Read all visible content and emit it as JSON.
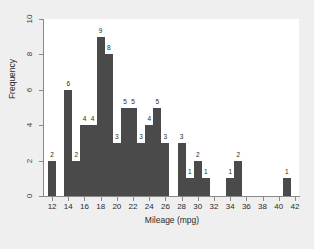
{
  "chart_data": {
    "type": "bar",
    "title": "",
    "subtitle": "",
    "xlabel": "Mileage (mpg)",
    "ylabel": "Frequency",
    "xlim": [
      11.0,
      42.5
    ],
    "ylim": [
      0,
      10
    ],
    "grid": false,
    "legend": null,
    "bar_width": 1,
    "bar_color": "#4a4a4a",
    "plot_background": "#ffffff",
    "figure_background": "#efefef",
    "axis_color": "#8a8a8a",
    "show_value_labels": true,
    "x_ticks": [
      12,
      14,
      16,
      18,
      20,
      22,
      24,
      26,
      28,
      30,
      32,
      34,
      36,
      38,
      40,
      42
    ],
    "x_tick_labels": [
      "12",
      "14",
      "16",
      "18",
      "20",
      "22",
      "24",
      "26",
      "28",
      "30",
      "32",
      "34",
      "36",
      "38",
      "40",
      "42"
    ],
    "y_ticks": [
      0,
      2,
      4,
      6,
      8,
      10
    ],
    "y_tick_labels": [
      "0",
      "2",
      "4",
      "6",
      "8",
      "10"
    ],
    "categories": [
      12,
      14,
      15,
      16,
      17,
      18,
      19,
      20,
      21,
      22,
      23,
      24,
      25,
      26,
      28,
      29,
      30,
      31,
      34,
      35,
      41
    ],
    "values": [
      2,
      6,
      2,
      4,
      4,
      9,
      8,
      3,
      5,
      5,
      3,
      4,
      5,
      3,
      3,
      1,
      2,
      1,
      1,
      2,
      1
    ],
    "bars": [
      {
        "x": 12,
        "value": 2,
        "label": "2"
      },
      {
        "x": 14,
        "value": 6,
        "label": "6"
      },
      {
        "x": 15,
        "value": 2,
        "label": "2"
      },
      {
        "x": 16,
        "value": 4,
        "label": "4"
      },
      {
        "x": 17,
        "value": 4,
        "label": "4"
      },
      {
        "x": 18,
        "value": 9,
        "label": "9"
      },
      {
        "x": 19,
        "value": 8,
        "label": "8"
      },
      {
        "x": 20,
        "value": 3,
        "label": "3"
      },
      {
        "x": 21,
        "value": 5,
        "label": "5"
      },
      {
        "x": 22,
        "value": 5,
        "label": "5"
      },
      {
        "x": 23,
        "value": 3,
        "label": "3"
      },
      {
        "x": 24,
        "value": 4,
        "label": "4"
      },
      {
        "x": 25,
        "value": 5,
        "label": "5"
      },
      {
        "x": 26,
        "value": 3,
        "label": "3"
      },
      {
        "x": 28,
        "value": 3,
        "label": "3"
      },
      {
        "x": 29,
        "value": 1,
        "label": "1"
      },
      {
        "x": 30,
        "value": 2,
        "label": "2"
      },
      {
        "x": 31,
        "value": 1,
        "label": "1"
      },
      {
        "x": 34,
        "value": 1,
        "label": "1"
      },
      {
        "x": 35,
        "value": 2,
        "label": "2"
      },
      {
        "x": 41,
        "value": 1,
        "label": "1"
      }
    ],
    "empty_bins": [
      13,
      27,
      32,
      33,
      36,
      37,
      38,
      39,
      40
    ],
    "total_count": 75
  }
}
